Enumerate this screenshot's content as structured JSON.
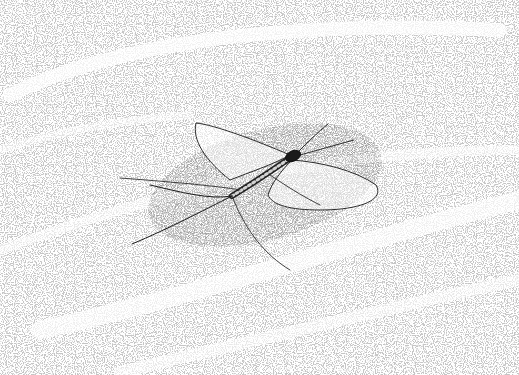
{
  "image": {
    "subject": "mayfly",
    "style": "stipple ink illustration",
    "background_color": "#ffffff",
    "ink_color": "#1a1a1a",
    "stipple_color": "#8a8a8a"
  }
}
